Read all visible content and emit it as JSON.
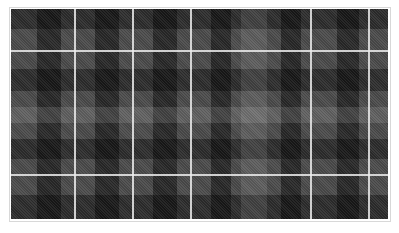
{
  "image": {
    "subject": "tartan plaid fabric swatch",
    "colors": {
      "base": "#4a4a4a",
      "dark_band": "#1a1a1a",
      "medium_band": "#3a3a3a",
      "light_band": "#6a6a6a",
      "stripe": "#ebebeb",
      "frame": "#d8d8d8",
      "background": "#ffffff"
    },
    "dark_vertical_bands_x": [
      [
        26,
        50
      ],
      [
        84,
        108
      ],
      [
        142,
        166
      ],
      [
        200,
        220
      ],
      [
        270,
        290
      ],
      [
        326,
        348
      ]
    ],
    "dark_horizontal_bands_y": [
      [
        0,
        20
      ],
      [
        60,
        82
      ],
      [
        130,
        150
      ],
      [
        186,
        210
      ]
    ],
    "light_horizontal_band_y": [
      98,
      114
    ],
    "light_vertical_band_x": [
      230,
      256
    ],
    "white_vertical_lines_x": [
      63,
      121,
      179,
      299,
      357
    ],
    "white_horizontal_lines_y": [
      41,
      165
    ]
  }
}
